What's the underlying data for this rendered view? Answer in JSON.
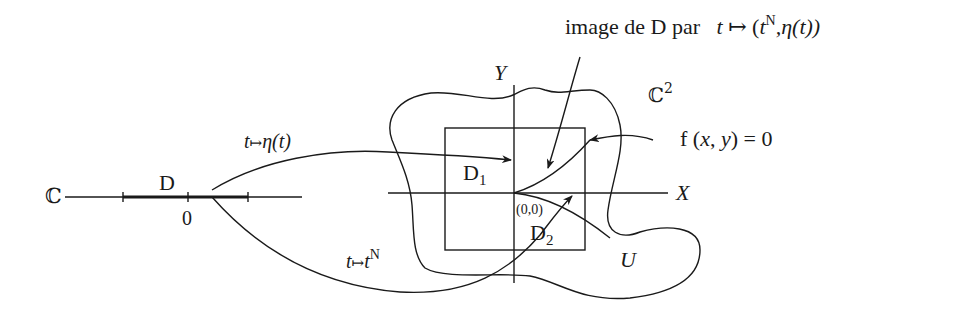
{
  "figure": {
    "colors": {
      "ink": "#1a1a1a",
      "background": "#ffffff"
    },
    "complex_line": {
      "label": "ℂ",
      "disc_label": "D",
      "origin_label": "0"
    },
    "maps": {
      "eta": {
        "var": "t",
        "arrow": "↦",
        "target": "η(t)"
      },
      "power": {
        "var": "t",
        "arrow": "↦",
        "base": "t",
        "exponent": "N"
      }
    },
    "plane": {
      "label": "ℂ",
      "exponent": "2",
      "axis_x": "X",
      "axis_y": "Y",
      "origin": "(0,0)",
      "neighborhood": "U",
      "region_1": {
        "base": "D",
        "sub": "1"
      },
      "region_2": {
        "base": "D",
        "sub": "2"
      },
      "curve_equation": "f (x, y) = 0"
    },
    "caption": {
      "prefix": "image de D par",
      "map_var": "t",
      "map_arrow": "↦",
      "map_open": "(",
      "map_t": "t",
      "map_exp": "N",
      "map_rest": ",η(t))"
    }
  }
}
